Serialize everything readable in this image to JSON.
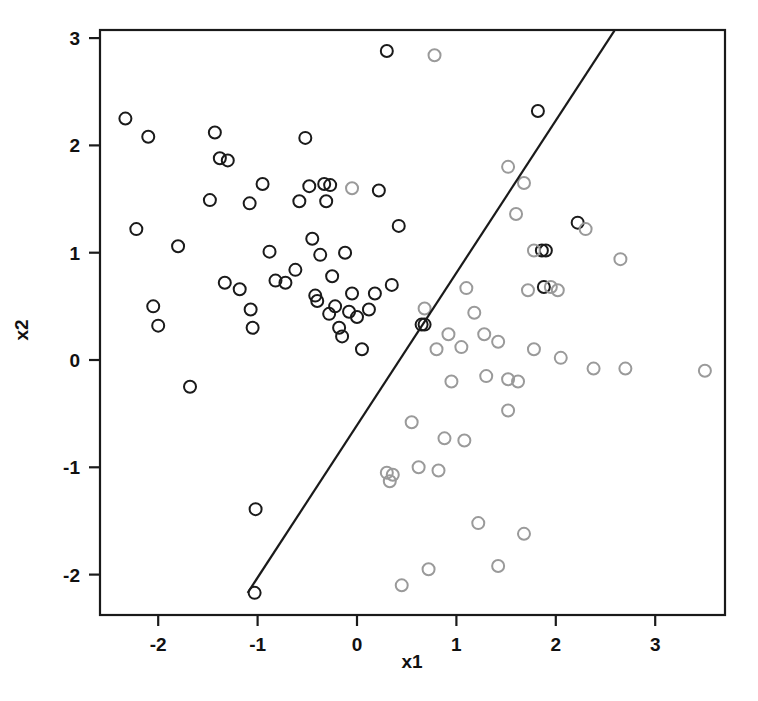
{
  "chart_data": {
    "type": "scatter",
    "title": "",
    "xlabel": "x1",
    "ylabel": "x2",
    "xlim": [
      -2.59,
      3.7
    ],
    "ylim": [
      -2.45,
      3.07
    ],
    "xticks": [
      -2,
      -1,
      0,
      1,
      2,
      3
    ],
    "yticks": [
      -2,
      -1,
      0,
      1,
      2,
      3
    ],
    "grid": false,
    "legend": false,
    "frame": "box",
    "colors": {
      "class_black": "#1a1a1a",
      "class_gray": "#9a9a9a",
      "boundary": "#1a1a1a",
      "axis": "#1a1a1a",
      "background": "#ffffff"
    },
    "marker": {
      "shape": "circle-open",
      "radius_px": 6,
      "stroke_width_px": 2
    },
    "annotations": [
      {
        "name": "decision-boundary",
        "type": "line",
        "p1": {
          "x": -1.1,
          "y": -2.17
        },
        "p2": {
          "x": 2.59,
          "y": 3.07
        }
      }
    ],
    "series": [
      {
        "name": "class_black",
        "color": "#1a1a1a",
        "points": [
          [
            -2.33,
            2.25
          ],
          [
            -2.1,
            2.08
          ],
          [
            -2.22,
            1.22
          ],
          [
            -2.05,
            0.5
          ],
          [
            -2.0,
            0.32
          ],
          [
            -1.8,
            1.06
          ],
          [
            -1.68,
            -0.25
          ],
          [
            -1.43,
            2.12
          ],
          [
            -1.48,
            1.49
          ],
          [
            -1.38,
            1.88
          ],
          [
            -1.3,
            1.86
          ],
          [
            -1.33,
            0.72
          ],
          [
            -1.18,
            0.66
          ],
          [
            -1.08,
            1.46
          ],
          [
            -1.07,
            0.47
          ],
          [
            -1.05,
            0.3
          ],
          [
            -1.02,
            -1.39
          ],
          [
            -1.03,
            -2.17
          ],
          [
            -0.95,
            1.64
          ],
          [
            -0.88,
            1.01
          ],
          [
            -0.82,
            0.74
          ],
          [
            -0.72,
            0.72
          ],
          [
            -0.62,
            0.84
          ],
          [
            -0.58,
            1.48
          ],
          [
            -0.52,
            2.07
          ],
          [
            -0.48,
            1.62
          ],
          [
            -0.45,
            1.13
          ],
          [
            -0.42,
            0.6
          ],
          [
            -0.4,
            0.55
          ],
          [
            -0.37,
            0.98
          ],
          [
            -0.33,
            1.64
          ],
          [
            -0.31,
            1.48
          ],
          [
            -0.28,
            0.43
          ],
          [
            -0.25,
            0.78
          ],
          [
            -0.22,
            0.5
          ],
          [
            -0.18,
            0.3
          ],
          [
            -0.15,
            0.22
          ],
          [
            -0.12,
            1.0
          ],
          [
            -0.08,
            0.45
          ],
          [
            -0.05,
            0.62
          ],
          [
            0.0,
            0.4
          ],
          [
            0.05,
            0.1
          ],
          [
            0.12,
            0.47
          ],
          [
            0.18,
            0.62
          ],
          [
            0.22,
            1.58
          ],
          [
            0.3,
            2.88
          ],
          [
            0.35,
            0.7
          ],
          [
            0.42,
            1.25
          ],
          [
            0.65,
            0.33
          ],
          [
            0.68,
            0.33
          ],
          [
            1.82,
            2.32
          ],
          [
            1.86,
            1.02
          ],
          [
            1.9,
            1.02
          ],
          [
            1.88,
            0.68
          ],
          [
            2.22,
            1.28
          ],
          [
            -0.27,
            1.63
          ]
        ]
      },
      {
        "name": "class_gray",
        "color": "#9a9a9a",
        "points": [
          [
            -0.05,
            1.6
          ],
          [
            0.78,
            2.84
          ],
          [
            1.52,
            1.8
          ],
          [
            1.6,
            1.36
          ],
          [
            1.68,
            1.65
          ],
          [
            1.78,
            1.02
          ],
          [
            1.72,
            0.65
          ],
          [
            1.95,
            0.68
          ],
          [
            2.3,
            1.22
          ],
          [
            2.65,
            0.94
          ],
          [
            1.1,
            0.67
          ],
          [
            1.18,
            0.44
          ],
          [
            1.28,
            0.24
          ],
          [
            1.42,
            0.17
          ],
          [
            0.92,
            0.24
          ],
          [
            0.8,
            0.1
          ],
          [
            1.05,
            0.12
          ],
          [
            1.3,
            -0.15
          ],
          [
            1.52,
            -0.18
          ],
          [
            1.78,
            0.1
          ],
          [
            2.05,
            0.02
          ],
          [
            2.38,
            -0.08
          ],
          [
            2.7,
            -0.08
          ],
          [
            3.5,
            -0.1
          ],
          [
            0.55,
            -0.58
          ],
          [
            0.3,
            -1.05
          ],
          [
            0.36,
            -1.07
          ],
          [
            0.33,
            -1.13
          ],
          [
            0.62,
            -1.0
          ],
          [
            0.45,
            -2.1
          ],
          [
            0.88,
            -0.73
          ],
          [
            0.82,
            -1.03
          ],
          [
            1.08,
            -0.75
          ],
          [
            1.22,
            -1.52
          ],
          [
            1.42,
            -1.92
          ],
          [
            1.52,
            -0.47
          ],
          [
            1.68,
            -1.62
          ],
          [
            0.72,
            -1.95
          ],
          [
            0.95,
            -0.2
          ],
          [
            1.62,
            -0.2
          ],
          [
            0.68,
            0.48
          ],
          [
            2.02,
            0.65
          ]
        ]
      }
    ]
  },
  "plot": {
    "box": {
      "left": 100,
      "top": 30,
      "right": 725,
      "bottom": 615
    },
    "px_per_unit_x": 99.4,
    "px_per_unit_y": 107.3,
    "origin_px": {
      "x": 357,
      "y": 360
    },
    "xlabel_text": "x1",
    "ylabel_text": "x2"
  }
}
